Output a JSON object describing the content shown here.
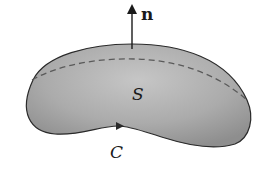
{
  "diagram": {
    "type": "surface-with-boundary",
    "labels": {
      "normal_vector": "n",
      "surface": "S",
      "boundary_curve": "C"
    },
    "colors": {
      "surface_fill": "#a9a9a9",
      "surface_highlight": "#c4c4c4",
      "outline": "#2a2a2a",
      "dashed_curve": "#5a5a5a",
      "background": "#ffffff"
    }
  }
}
